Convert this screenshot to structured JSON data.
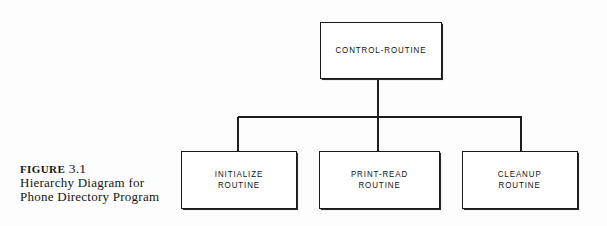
{
  "figure": {
    "caption_label": "FIGURE",
    "caption_number": "3.1",
    "caption_line2": "Hierarchy Diagram for",
    "caption_line3": "Phone Directory Program"
  },
  "diagram": {
    "type": "hierarchy-chart",
    "line_color": "#1d1d1d",
    "box_fill": "#ffffff",
    "background": "#fdfdfd",
    "root": {
      "label": "CONTROL-ROUTINE",
      "x": 320,
      "y": 22,
      "w": 122,
      "h": 57
    },
    "children": [
      {
        "label": "INITIALIZE\nROUTINE",
        "x": 181,
        "y": 151,
        "w": 116,
        "h": 58
      },
      {
        "label": "PRINT-READ\nROUTINE",
        "x": 319,
        "y": 151,
        "w": 121,
        "h": 58
      },
      {
        "label": "CLEANUP\nROUTINE",
        "x": 462,
        "y": 151,
        "w": 116,
        "h": 58
      }
    ],
    "edges": {
      "root_stem": {
        "x": 378,
        "y": 79,
        "length": 38
      },
      "bus": {
        "x": 238,
        "y": 117,
        "length": 284
      },
      "drop_left": {
        "x": 238,
        "y": 117,
        "length": 35
      },
      "drop_middle": {
        "x": 378,
        "y": 117,
        "length": 35
      },
      "drop_right": {
        "x": 521,
        "y": 117,
        "length": 35
      }
    }
  }
}
